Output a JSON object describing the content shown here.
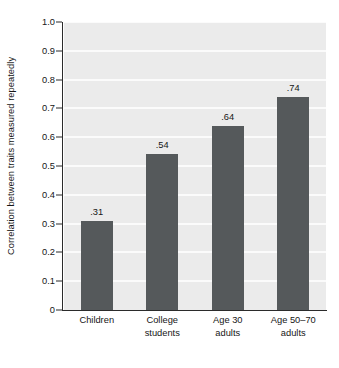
{
  "chart_data": {
    "type": "bar",
    "title": "",
    "xlabel": "",
    "ylabel": "Correlation between traits measured repeatedly",
    "categories": [
      "Children",
      "College students",
      "Age 30 adults",
      "Age 50–70 adults"
    ],
    "category_lines": [
      [
        "Children"
      ],
      [
        "College",
        "students"
      ],
      [
        "Age 30",
        "adults"
      ],
      [
        "Age 50–70",
        "adults"
      ]
    ],
    "values": [
      0.31,
      0.54,
      0.64,
      0.74
    ],
    "value_labels": [
      ".31",
      ".54",
      ".64",
      ".74"
    ],
    "ylim": [
      0,
      1.0
    ],
    "y_ticks": [
      1.0,
      0.9,
      0.8,
      0.7,
      0.6,
      0.5,
      0.4,
      0.3,
      0.2,
      0.1,
      0
    ],
    "y_tick_labels": [
      "1.0",
      "0.9",
      "0.8",
      "0.7",
      "0.6",
      "0.5",
      "0.4",
      "0.3",
      "0.2",
      "0.1",
      "0"
    ],
    "grid": true,
    "grid_orientation": "horizontal",
    "legend": "none",
    "legend_position": "none",
    "colors": {
      "bar_fill": "#55595b",
      "panel_background": "#ebebeb",
      "gridline": "#fbfbfb",
      "axis": "#2b2b2b",
      "text": "#161616",
      "page_background": "#ffffff"
    }
  }
}
